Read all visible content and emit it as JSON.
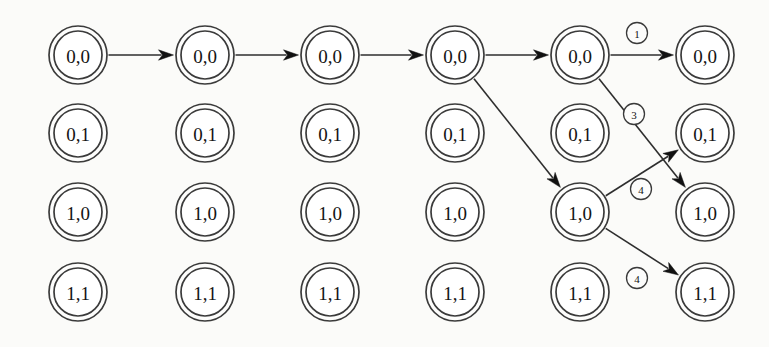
{
  "figure": {
    "kind": "state-transition-trellis-diagram",
    "background_color": "#fbfbf9",
    "stroke_color": "#2e2e2e",
    "node_fill_color": "#ffffff",
    "text_color": "#141414",
    "columns": 6,
    "rows": 4,
    "node_outer_radius": 29,
    "node_inner_radius": 24,
    "column_x": [
      78,
      205,
      330,
      455,
      580,
      705
    ],
    "row_y": [
      55,
      133,
      212,
      292
    ],
    "row_labels": [
      "0,0",
      "0,1",
      "1,0",
      "1,1"
    ]
  },
  "nodes": [
    {
      "id": "c1r1",
      "label": "0,0",
      "col": 0,
      "row": 0
    },
    {
      "id": "c1r2",
      "label": "0,1",
      "col": 0,
      "row": 1
    },
    {
      "id": "c1r3",
      "label": "1,0",
      "col": 0,
      "row": 2
    },
    {
      "id": "c1r4",
      "label": "1,1",
      "col": 0,
      "row": 3
    },
    {
      "id": "c2r1",
      "label": "0,0",
      "col": 1,
      "row": 0
    },
    {
      "id": "c2r2",
      "label": "0,1",
      "col": 1,
      "row": 1
    },
    {
      "id": "c2r3",
      "label": "1,0",
      "col": 1,
      "row": 2
    },
    {
      "id": "c2r4",
      "label": "1,1",
      "col": 1,
      "row": 3
    },
    {
      "id": "c3r1",
      "label": "0,0",
      "col": 2,
      "row": 0
    },
    {
      "id": "c3r2",
      "label": "0,1",
      "col": 2,
      "row": 1
    },
    {
      "id": "c3r3",
      "label": "1,0",
      "col": 2,
      "row": 2
    },
    {
      "id": "c3r4",
      "label": "1,1",
      "col": 2,
      "row": 3
    },
    {
      "id": "c4r1",
      "label": "0,0",
      "col": 3,
      "row": 0
    },
    {
      "id": "c4r2",
      "label": "0,1",
      "col": 3,
      "row": 1
    },
    {
      "id": "c4r3",
      "label": "1,0",
      "col": 3,
      "row": 2
    },
    {
      "id": "c4r4",
      "label": "1,1",
      "col": 3,
      "row": 3
    },
    {
      "id": "c5r1",
      "label": "0,0",
      "col": 4,
      "row": 0
    },
    {
      "id": "c5r2",
      "label": "0,1",
      "col": 4,
      "row": 1
    },
    {
      "id": "c5r3",
      "label": "1,0",
      "col": 4,
      "row": 2
    },
    {
      "id": "c5r4",
      "label": "1,1",
      "col": 4,
      "row": 3
    },
    {
      "id": "c6r1",
      "label": "0,0",
      "col": 5,
      "row": 0
    },
    {
      "id": "c6r2",
      "label": "0,1",
      "col": 5,
      "row": 1
    },
    {
      "id": "c6r3",
      "label": "1,0",
      "col": 5,
      "row": 2
    },
    {
      "id": "c6r4",
      "label": "1,1",
      "col": 5,
      "row": 3
    }
  ],
  "edges": [
    {
      "id": "e1",
      "from": "c1r1",
      "to": "c2r1",
      "label": null,
      "kind": "horizontal"
    },
    {
      "id": "e2",
      "from": "c2r1",
      "to": "c3r1",
      "label": null,
      "kind": "horizontal"
    },
    {
      "id": "e3",
      "from": "c3r1",
      "to": "c4r1",
      "label": null,
      "kind": "horizontal"
    },
    {
      "id": "e4",
      "from": "c4r1",
      "to": "c5r1",
      "label": null,
      "kind": "horizontal"
    },
    {
      "id": "e5",
      "from": "c5r1",
      "to": "c6r1",
      "label": "1",
      "kind": "horizontal"
    },
    {
      "id": "e6",
      "from": "c4r1",
      "to": "c5r3",
      "label": null,
      "kind": "diagonal-down"
    },
    {
      "id": "e7",
      "from": "c5r1",
      "to": "c6r3",
      "label": "3",
      "kind": "diagonal-down"
    },
    {
      "id": "e8",
      "from": "c5r3",
      "to": "c6r2",
      "label": "4",
      "kind": "diagonal-up"
    },
    {
      "id": "e9",
      "from": "c5r3",
      "to": "c6r4",
      "label": "4",
      "kind": "diagonal-down"
    }
  ],
  "edge_labels": [
    {
      "for": "e5",
      "text": "1",
      "x": 637,
      "y": 33
    },
    {
      "for": "e7",
      "text": "3",
      "x": 634,
      "y": 114
    },
    {
      "for": "e8",
      "text": "4",
      "x": 641,
      "y": 189
    },
    {
      "for": "e9",
      "text": "4",
      "x": 637,
      "y": 278
    }
  ]
}
